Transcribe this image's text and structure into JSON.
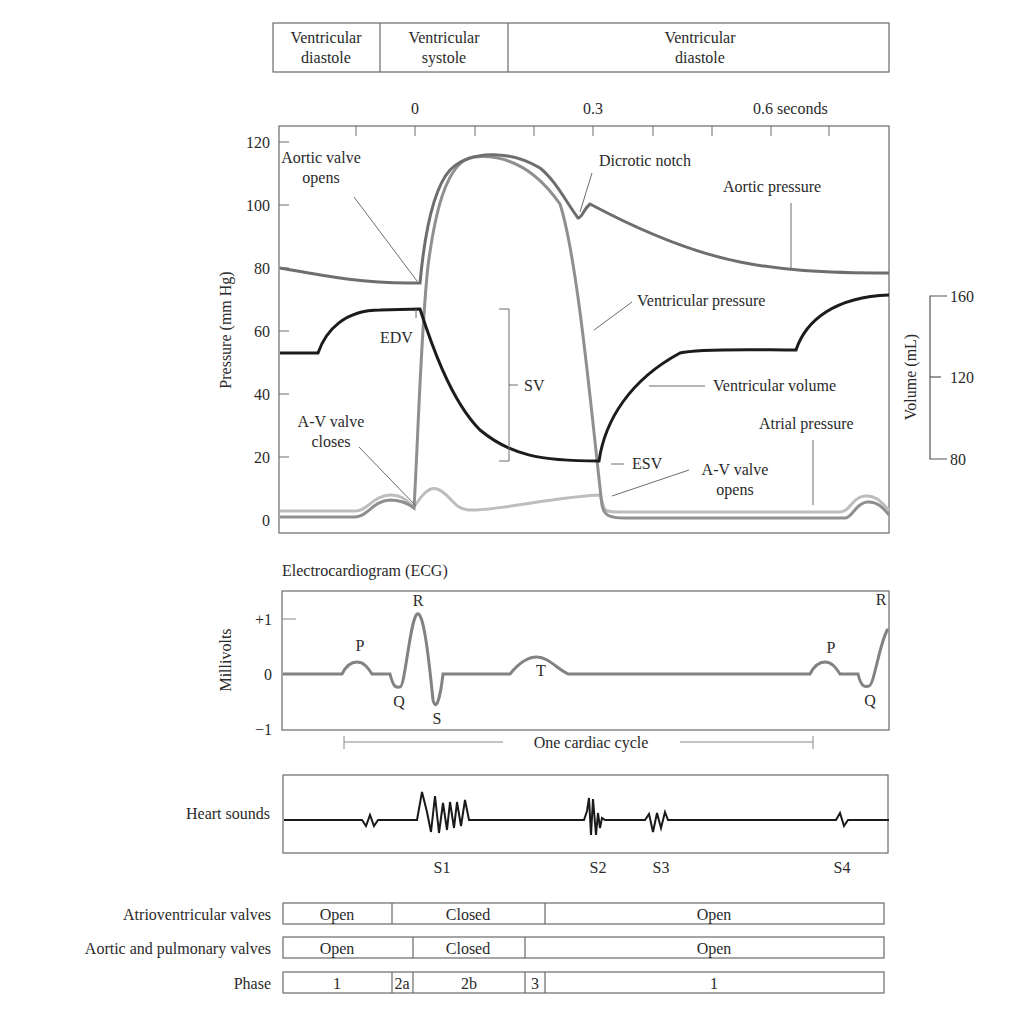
{
  "cardiac_phases_header": [
    {
      "line1": "Ventricular",
      "line2": "diastole"
    },
    {
      "line1": "Ventricular",
      "line2": "systole"
    },
    {
      "line1": "Ventricular",
      "line2": "diastole"
    }
  ],
  "time_axis": {
    "ticks": [
      "0",
      "0.3",
      "0.6 seconds"
    ]
  },
  "pressure_panel": {
    "ylabel": "Pressure (mm Hg)",
    "yticks": [
      "0",
      "20",
      "40",
      "60",
      "80",
      "100",
      "120"
    ],
    "volume_label": "Volume (mL)",
    "volume_ticks": [
      "80",
      "120",
      "160"
    ],
    "annotations": {
      "aortic_valve_opens_1": "Aortic valve",
      "aortic_valve_opens_2": "opens",
      "dicrotic_notch": "Dicrotic notch",
      "aortic_pressure": "Aortic pressure",
      "ventricular_pressure": "Ventricular pressure",
      "edv": "EDV",
      "sv": "SV",
      "esv": "ESV",
      "ventricular_volume": "Ventricular volume",
      "atrial_pressure": "Atrial pressure",
      "av_valve_closes_1": "A-V valve",
      "av_valve_closes_2": "closes",
      "av_valve_opens_1": "A-V valve",
      "av_valve_opens_2": "opens"
    }
  },
  "ecg_panel": {
    "title": "Electrocardiogram (ECG)",
    "ylabel": "Millivolts",
    "yticks": [
      "+1",
      "0",
      "−1"
    ],
    "waves": {
      "p1": "P",
      "q1": "Q",
      "r1": "R",
      "s1": "S",
      "t": "T",
      "p2": "P",
      "q2": "Q",
      "r2": "R"
    },
    "cycle_label": "One cardiac cycle"
  },
  "heart_sounds_panel": {
    "label": "Heart sounds",
    "sounds": [
      "S1",
      "S2",
      "S3",
      "S4"
    ]
  },
  "valve_table": {
    "rows": [
      {
        "label": "Atrioventricular valves",
        "cells": [
          "Open",
          "Closed",
          "Open"
        ]
      },
      {
        "label": "Aortic and pulmonary valves",
        "cells": [
          "Open",
          "Closed",
          "Open"
        ]
      },
      {
        "label": "Phase",
        "cells": [
          "1",
          "2a",
          "2b",
          "3",
          "1"
        ]
      }
    ]
  },
  "colors": {
    "aortic_pressure": "#6e6e6e",
    "ventricular_pressure": "#8c8c8c",
    "ventricular_volume": "#1c1c1c",
    "atrial_pressure": "#b8b8b8",
    "ecg": "#808080",
    "heart_sounds": "#1a1a1a"
  }
}
